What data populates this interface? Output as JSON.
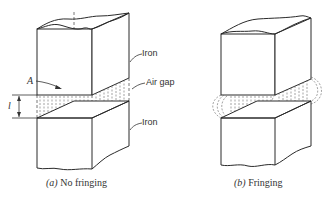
{
  "figure": {
    "panels": [
      {
        "id": "a",
        "caption_tag": "(a)",
        "caption_text": "No fringing",
        "labels": {
          "iron_upper": "Iron",
          "air_gap": "Air gap",
          "iron_lower": "Iron",
          "area_symbol": "A",
          "length_symbol": "l"
        }
      },
      {
        "id": "b",
        "caption_tag": "(b)",
        "caption_text": "Fringing"
      }
    ],
    "colors": {
      "line": "#2a2a2a",
      "background": "#ffffff"
    }
  }
}
